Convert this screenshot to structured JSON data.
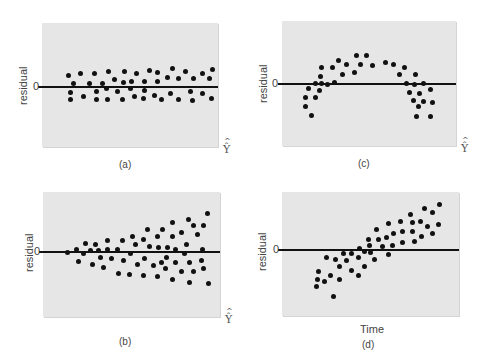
{
  "chart_data": [
    {
      "id": "a",
      "type": "scatter",
      "caption": "(a)",
      "ylabel": "residual",
      "zero_tick": "0",
      "xlabel": "Ŷ",
      "xlabel_type": "yhat",
      "description": "Random constant-variance band around zero",
      "box": {
        "left": 42,
        "top": 23,
        "width": 176,
        "height": 124
      },
      "zero_y": 87,
      "ylabel_pos": {
        "x": 17,
        "y": 105
      },
      "zero_pos": {
        "x": 33,
        "y": 80
      },
      "xlabel_pos": {
        "x": 223,
        "y": 143
      },
      "caption_pos": {
        "x": 119,
        "y": 159
      },
      "points": [
        [
          68,
          75
        ],
        [
          73,
          83
        ],
        [
          70,
          92
        ],
        [
          70,
          99
        ],
        [
          80,
          73
        ],
        [
          83,
          96
        ],
        [
          89,
          83
        ],
        [
          94,
          73
        ],
        [
          96,
          91
        ],
        [
          96,
          99
        ],
        [
          102,
          83
        ],
        [
          106,
          88
        ],
        [
          107,
          99
        ],
        [
          108,
          71
        ],
        [
          114,
          79
        ],
        [
          117,
          91
        ],
        [
          122,
          99
        ],
        [
          124,
          71
        ],
        [
          123,
          82
        ],
        [
          131,
          81
        ],
        [
          130,
          88
        ],
        [
          134,
          96
        ],
        [
          136,
          73
        ],
        [
          144,
          81
        ],
        [
          144,
          90
        ],
        [
          143,
          98
        ],
        [
          149,
          70
        ],
        [
          154,
          95
        ],
        [
          157,
          72
        ],
        [
          157,
          81
        ],
        [
          161,
          99
        ],
        [
          167,
          77
        ],
        [
          170,
          93
        ],
        [
          172,
          68
        ],
        [
          178,
          78
        ],
        [
          178,
          99
        ],
        [
          185,
          71
        ],
        [
          190,
          91
        ],
        [
          192,
          100
        ],
        [
          193,
          78
        ],
        [
          202,
          73
        ],
        [
          202,
          93
        ],
        [
          209,
          78
        ],
        [
          211,
          98
        ],
        [
          212,
          69
        ]
      ]
    },
    {
      "id": "c",
      "type": "scatter",
      "caption": "(c)",
      "ylabel": "residual",
      "zero_tick": "0",
      "xlabel": "Ŷ",
      "xlabel_type": "yhat",
      "description": "Curved (inverted-U) pattern indicating nonlinearity",
      "box": {
        "left": 282,
        "top": 21,
        "width": 174,
        "height": 125
      },
      "zero_y": 84,
      "ylabel_pos": {
        "x": 257,
        "y": 103
      },
      "zero_pos": {
        "x": 272,
        "y": 77
      },
      "xlabel_pos": {
        "x": 461,
        "y": 142
      },
      "caption_pos": {
        "x": 358,
        "y": 158
      },
      "points": [
        [
          305,
          97
        ],
        [
          305,
          106
        ],
        [
          311,
          115
        ],
        [
          308,
          88
        ],
        [
          315,
          83
        ],
        [
          315,
          97
        ],
        [
          319,
          90
        ],
        [
          321,
          83
        ],
        [
          320,
          76
        ],
        [
          321,
          67
        ],
        [
          327,
          84
        ],
        [
          332,
          67
        ],
        [
          334,
          82
        ],
        [
          338,
          60
        ],
        [
          342,
          74
        ],
        [
          346,
          64
        ],
        [
          354,
          72
        ],
        [
          356,
          55
        ],
        [
          360,
          64
        ],
        [
          366,
          55
        ],
        [
          372,
          65
        ],
        [
          385,
          62
        ],
        [
          393,
          64
        ],
        [
          404,
          67
        ],
        [
          399,
          74
        ],
        [
          415,
          74
        ],
        [
          406,
          83
        ],
        [
          414,
          84
        ],
        [
          423,
          83
        ],
        [
          409,
          92
        ],
        [
          419,
          93
        ],
        [
          430,
          89
        ],
        [
          413,
          100
        ],
        [
          423,
          101
        ],
        [
          432,
          102
        ],
        [
          418,
          106
        ],
        [
          416,
          116
        ],
        [
          430,
          116
        ]
      ]
    },
    {
      "id": "b",
      "type": "scatter",
      "caption": "(b)",
      "ylabel": "residual",
      "zero_tick": "0",
      "xlabel": "Ŷ",
      "xlabel_type": "yhat",
      "description": "Funnel-shaped spread increasing with fitted value (heteroscedasticity)",
      "box": {
        "left": 43,
        "top": 192,
        "width": 177,
        "height": 125
      },
      "zero_y": 252,
      "ylabel_pos": {
        "x": 23,
        "y": 272
      },
      "zero_pos": {
        "x": 34,
        "y": 245
      },
      "xlabel_pos": {
        "x": 225,
        "y": 313
      },
      "caption_pos": {
        "x": 119,
        "y": 336
      },
      "points": [
        [
          67,
          252
        ],
        [
          76,
          249
        ],
        [
          78,
          261
        ],
        [
          83,
          253
        ],
        [
          85,
          243
        ],
        [
          90,
          250
        ],
        [
          92,
          264
        ],
        [
          95,
          244
        ],
        [
          98,
          250
        ],
        [
          100,
          257
        ],
        [
          103,
          267
        ],
        [
          107,
          240
        ],
        [
          107,
          249
        ],
        [
          111,
          258
        ],
        [
          117,
          249
        ],
        [
          118,
          273
        ],
        [
          122,
          240
        ],
        [
          123,
          260
        ],
        [
          129,
          274
        ],
        [
          130,
          253
        ],
        [
          132,
          236
        ],
        [
          135,
          244
        ],
        [
          137,
          264
        ],
        [
          143,
          239
        ],
        [
          144,
          258
        ],
        [
          143,
          275
        ],
        [
          147,
          229
        ],
        [
          149,
          246
        ],
        [
          153,
          265
        ],
        [
          157,
          236
        ],
        [
          157,
          276
        ],
        [
          158,
          247
        ],
        [
          161,
          262
        ],
        [
          162,
          229
        ],
        [
          165,
          268
        ],
        [
          166,
          257
        ],
        [
          167,
          247
        ],
        [
          172,
          222
        ],
        [
          172,
          236
        ],
        [
          172,
          279
        ],
        [
          175,
          249
        ],
        [
          175,
          262
        ],
        [
          181,
          232
        ],
        [
          181,
          271
        ],
        [
          184,
          253
        ],
        [
          186,
          244
        ],
        [
          188,
          219
        ],
        [
          189,
          262
        ],
        [
          189,
          282
        ],
        [
          193,
          225
        ],
        [
          193,
          271
        ],
        [
          197,
          234
        ],
        [
          201,
          260
        ],
        [
          202,
          249
        ],
        [
          203,
          268
        ],
        [
          203,
          225
        ],
        [
          207,
          213
        ],
        [
          208,
          283
        ]
      ]
    },
    {
      "id": "d",
      "type": "scatter",
      "caption": "(d)",
      "ylabel": "residual",
      "zero_tick": "0",
      "xlabel": "Time",
      "xlabel_type": "text",
      "description": "Linear trend in residuals over time",
      "box": {
        "left": 282,
        "top": 192,
        "width": 177,
        "height": 124
      },
      "zero_y": 250,
      "ylabel_pos": {
        "x": 256,
        "y": 271
      },
      "zero_pos": {
        "x": 273,
        "y": 243
      },
      "xlabel_pos": {
        "x": 360,
        "y": 323
      },
      "caption_pos": {
        "x": 362,
        "y": 339
      },
      "points": [
        [
          316,
          286
        ],
        [
          317,
          279
        ],
        [
          318,
          271
        ],
        [
          324,
          281
        ],
        [
          326,
          257
        ],
        [
          330,
          275
        ],
        [
          333,
          296
        ],
        [
          335,
          259
        ],
        [
          339,
          279
        ],
        [
          339,
          266
        ],
        [
          343,
          253
        ],
        [
          346,
          260
        ],
        [
          351,
          270
        ],
        [
          351,
          253
        ],
        [
          358,
          275
        ],
        [
          358,
          257
        ],
        [
          359,
          248
        ],
        [
          364,
          266
        ],
        [
          364,
          251
        ],
        [
          368,
          239
        ],
        [
          369,
          245
        ],
        [
          370,
          252
        ],
        [
          374,
          259
        ],
        [
          376,
          229
        ],
        [
          378,
          239
        ],
        [
          382,
          246
        ],
        [
          386,
          237
        ],
        [
          388,
          254
        ],
        [
          388,
          223
        ],
        [
          392,
          245
        ],
        [
          393,
          233
        ],
        [
          400,
          221
        ],
        [
          402,
          242
        ],
        [
          402,
          231
        ],
        [
          410,
          214
        ],
        [
          412,
          222
        ],
        [
          412,
          231
        ],
        [
          414,
          241
        ],
        [
          420,
          221
        ],
        [
          421,
          236
        ],
        [
          424,
          208
        ],
        [
          427,
          226
        ],
        [
          432,
          212
        ],
        [
          432,
          233
        ],
        [
          438,
          224
        ],
        [
          439,
          204
        ]
      ]
    }
  ]
}
